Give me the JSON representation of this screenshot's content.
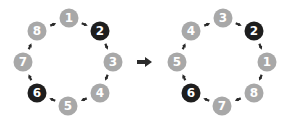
{
  "colors": {
    "node_default": "#a8a8a8",
    "node_highlight": "#1e1e1e",
    "arrow": "#2b2b2b",
    "label": "#ffffff"
  },
  "left_ring": {
    "nodes": [
      {
        "label": "1",
        "x": 69,
        "y": 18,
        "highlight": false
      },
      {
        "label": "2",
        "x": 100,
        "y": 31,
        "highlight": true
      },
      {
        "label": "3",
        "x": 113,
        "y": 62,
        "highlight": false
      },
      {
        "label": "4",
        "x": 100,
        "y": 93,
        "highlight": false
      },
      {
        "label": "5",
        "x": 68,
        "y": 106,
        "highlight": false
      },
      {
        "label": "6",
        "x": 37,
        "y": 93,
        "highlight": true
      },
      {
        "label": "7",
        "x": 23,
        "y": 62,
        "highlight": false
      },
      {
        "label": "8",
        "x": 37,
        "y": 31,
        "highlight": false
      }
    ]
  },
  "right_ring": {
    "nodes": [
      {
        "label": "3",
        "x": 223,
        "y": 18,
        "highlight": false
      },
      {
        "label": "2",
        "x": 254,
        "y": 31,
        "highlight": true
      },
      {
        "label": "1",
        "x": 267,
        "y": 62,
        "highlight": false
      },
      {
        "label": "8",
        "x": 254,
        "y": 93,
        "highlight": false
      },
      {
        "label": "7",
        "x": 222,
        "y": 106,
        "highlight": false
      },
      {
        "label": "6",
        "x": 191,
        "y": 93,
        "highlight": true
      },
      {
        "label": "5",
        "x": 177,
        "y": 62,
        "highlight": false
      },
      {
        "label": "4",
        "x": 191,
        "y": 31,
        "highlight": false
      }
    ]
  },
  "transform_arrow": {
    "x": 145,
    "y": 62
  }
}
